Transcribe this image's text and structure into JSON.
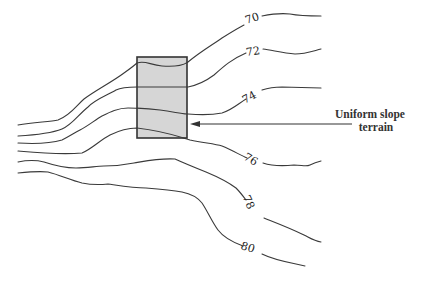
{
  "diagram": {
    "type": "topographic-contour-map",
    "contours": [
      {
        "elevation": "70",
        "label_x": 252,
        "label_y": 22,
        "label_rotate": -18,
        "path_a": "M18,125 C35,122 50,122 58,120 C70,116 76,106 84,99 C96,90 112,82 124,73 C131,68 135,65 137,63 C145,60 150,65 162,66 C175,67 184,65 188,62 C200,52 212,45 222,38 C230,33 238,28 244,25",
        "path_b": "M262,16 C272,14 282,13 290,14 C300,16 310,16 321,16"
      },
      {
        "elevation": "72",
        "label_x": 253,
        "label_y": 55,
        "label_rotate": -8,
        "path_a": "M18,136 C35,135 52,133 62,129 C72,125 78,115 88,107 C96,99 108,95 116,90 C122,87 130,87 137,87 L188,87 C198,85 206,81 214,75 C224,66 232,59 246,53",
        "path_b": "M263,49 C272,50 282,53 295,54 C305,54 313,51 321,49"
      },
      {
        "elevation": "74",
        "label_x": 249,
        "label_y": 101,
        "label_rotate": -28,
        "path_a": "M18,143 C35,144 52,143 62,140 C70,136 74,133 80,130 C88,126 95,120 102,116 C110,112 118,108 128,108 C136,108 145,108 160,110 C175,112 182,114 188,114 C200,115 212,115 222,113 C232,110 238,104 246,99",
        "path_b": "M262,90 C268,88 274,87 282,87 L321,88"
      },
      {
        "elevation": "76",
        "label_x": 251,
        "label_y": 163,
        "label_rotate": 30,
        "path_a": "M18,151 C40,153 60,155 82,153 C92,149 100,140 110,135 C118,131 128,128 137,128 C155,130 172,134 190,140 C205,143 215,144 222,146 C232,150 240,155 247,158",
        "path_b": "M263,163 C272,166 284,166 294,165 C302,165 306,167 310,165 C314,163 317,162 321,161"
      },
      {
        "elevation": "78",
        "label_x": 249,
        "label_y": 206,
        "label_rotate": 65,
        "path_a": "M18,162 C28,160 36,160 44,162 C56,166 66,168 76,168 C88,168 96,166 104,166 C114,166 124,165 134,163 C146,161 160,158 175,159 C186,164 196,168 206,172 C218,177 228,182 236,188 C240,192 243,196 246,200",
        "path_b": "M264,218 C274,222 290,228 304,235 C310,238 314,241 321,242"
      },
      {
        "elevation": "80",
        "label_x": 248,
        "label_y": 251,
        "label_rotate": 18,
        "path_a": "M18,173 C28,172 40,171 48,172 C60,175 70,180 82,183 C92,185 98,185 108,184 C122,186 134,188 146,188 C160,189 172,190 182,192 C192,194 198,198 202,203 C208,212 212,222 218,230 C224,238 232,242 243,246",
        "path_b": "M262,254 C272,259 286,262 296,264 L305,266"
      }
    ],
    "site": {
      "x": 137,
      "y": 57,
      "width": 50,
      "height": 81,
      "fill": "#d6d6d6"
    },
    "callout": {
      "line1": "Uniform slope",
      "line2": "terrain",
      "arrow_from_x": 352,
      "arrow_to_x": 190,
      "arrow_y": 124
    }
  }
}
